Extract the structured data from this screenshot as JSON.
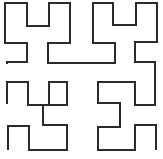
{
  "diagram": {
    "type": "space-filling-curve",
    "name": "Hilbert curve (order 3, drawn segment)",
    "stroke_color": "#2b2b2b",
    "stroke_width": 2,
    "background": "#ffffff",
    "points": [
      [
        7,
        64
      ],
      [
        7,
        62
      ],
      [
        27,
        62
      ],
      [
        27,
        43
      ],
      [
        5,
        43
      ],
      [
        5,
        3
      ],
      [
        27,
        3
      ],
      [
        27,
        26
      ],
      [
        49,
        26
      ],
      [
        49,
        3
      ],
      [
        70,
        3
      ],
      [
        70,
        43
      ],
      [
        48,
        43
      ],
      [
        48,
        63
      ],
      [
        92,
        63
      ],
      [
        93,
        63
      ],
      [
        115,
        63
      ],
      [
        115,
        43
      ],
      [
        93,
        43
      ],
      [
        93,
        3
      ],
      [
        113,
        3
      ],
      [
        113,
        25
      ],
      [
        136,
        25
      ],
      [
        136,
        3
      ],
      [
        157,
        3
      ],
      [
        157,
        42
      ],
      [
        135,
        42
      ],
      [
        135,
        62
      ],
      [
        155,
        62
      ],
      [
        155,
        80
      ],
      [
        155,
        105
      ],
      [
        135,
        105
      ],
      [
        135,
        82
      ],
      [
        98,
        82
      ],
      [
        98,
        103
      ],
      [
        120,
        103
      ],
      [
        120,
        127
      ],
      [
        98,
        127
      ],
      [
        98,
        150
      ],
      [
        135,
        150
      ],
      [
        135,
        125
      ],
      [
        156,
        125
      ],
      [
        156,
        150
      ]
    ],
    "points_lower_left": [
      [
        7,
        104
      ],
      [
        7,
        82
      ],
      [
        28,
        82
      ],
      [
        28,
        105
      ],
      [
        49,
        105
      ],
      [
        49,
        82
      ],
      [
        67,
        82
      ],
      [
        67,
        105
      ],
      [
        43,
        105
      ],
      [
        43,
        125
      ],
      [
        67,
        125
      ],
      [
        67,
        150
      ],
      [
        29,
        150
      ],
      [
        29,
        126
      ],
      [
        8,
        126
      ],
      [
        8,
        150
      ]
    ]
  }
}
